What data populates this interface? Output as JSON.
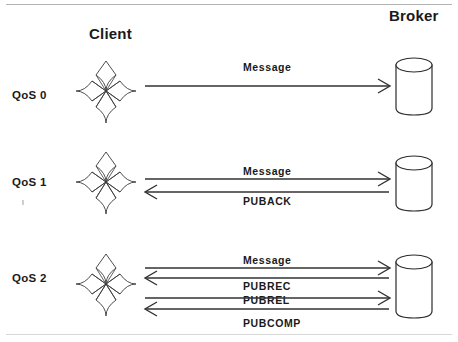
{
  "diagram": {
    "title_client": "Client",
    "title_broker": "Broker",
    "client_icon_name": "maltese-cross-client-icon",
    "broker_icon_name": "database-cylinder-broker-icon",
    "colors": {
      "stroke": "#2b2b2b",
      "arrow": "#323232",
      "text": "#1a1a1a",
      "rule": "#b4b4b4",
      "background": "#ffffff"
    },
    "levels": [
      {
        "id": "qos0",
        "label": "QoS 0",
        "messages": [
          {
            "text": "Message",
            "direction": "client-to-broker",
            "label_position": "above"
          }
        ]
      },
      {
        "id": "qos1",
        "label": "QoS 1",
        "messages": [
          {
            "text": "Message",
            "direction": "client-to-broker",
            "label_position": "above"
          },
          {
            "text": "PUBACK",
            "direction": "broker-to-client",
            "label_position": "below"
          }
        ]
      },
      {
        "id": "qos2",
        "label": "QoS 2",
        "messages": [
          {
            "text": "Message",
            "direction": "client-to-broker",
            "label_position": "above"
          },
          {
            "text": "PUBREC",
            "direction": "broker-to-client",
            "label_position": "below"
          },
          {
            "text": "PUBREL",
            "direction": "client-to-broker",
            "label_position": "above"
          },
          {
            "text": "PUBCOMP",
            "direction": "broker-to-client",
            "label_position": "below"
          }
        ]
      }
    ]
  }
}
